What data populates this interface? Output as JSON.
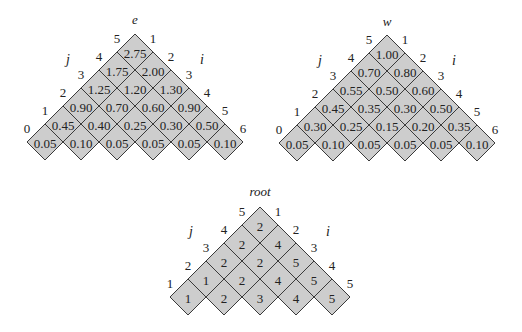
{
  "grids": [
    {
      "id": "e",
      "title": "e",
      "left_axis": "j",
      "right_axis": "i",
      "left_indices": [
        "0",
        "1",
        "2",
        "3",
        "4",
        "5"
      ],
      "right_indices": [
        "1",
        "2",
        "3",
        "4",
        "5",
        "6"
      ],
      "rows": [
        [
          "2.75"
        ],
        [
          "1.75",
          "2.00"
        ],
        [
          "1.25",
          "1.20",
          "1.30"
        ],
        [
          "0.90",
          "0.70",
          "0.60",
          "0.90"
        ],
        [
          "0.45",
          "0.40",
          "0.25",
          "0.30",
          "0.50"
        ],
        [
          "0.05",
          "0.10",
          "0.05",
          "0.05",
          "0.05",
          "0.10"
        ]
      ]
    },
    {
      "id": "w",
      "title": "w",
      "left_axis": "j",
      "right_axis": "i",
      "left_indices": [
        "0",
        "1",
        "2",
        "3",
        "4",
        "5"
      ],
      "right_indices": [
        "1",
        "2",
        "3",
        "4",
        "5",
        "6"
      ],
      "rows": [
        [
          "1.00"
        ],
        [
          "0.70",
          "0.80"
        ],
        [
          "0.55",
          "0.50",
          "0.60"
        ],
        [
          "0.45",
          "0.35",
          "0.30",
          "0.50"
        ],
        [
          "0.30",
          "0.25",
          "0.15",
          "0.20",
          "0.35"
        ],
        [
          "0.05",
          "0.10",
          "0.05",
          "0.05",
          "0.05",
          "0.10"
        ]
      ]
    },
    {
      "id": "root",
      "title": "root",
      "left_axis": "j",
      "right_axis": "i",
      "left_indices": [
        "1",
        "2",
        "3",
        "4",
        "5"
      ],
      "right_indices": [
        "1",
        "2",
        "3",
        "4",
        "5"
      ],
      "rows": [
        [
          "2"
        ],
        [
          "2",
          "4"
        ],
        [
          "2",
          "2",
          "5"
        ],
        [
          "1",
          "2",
          "4",
          "5"
        ],
        [
          "1",
          "2",
          "3",
          "4",
          "5"
        ]
      ]
    }
  ]
}
